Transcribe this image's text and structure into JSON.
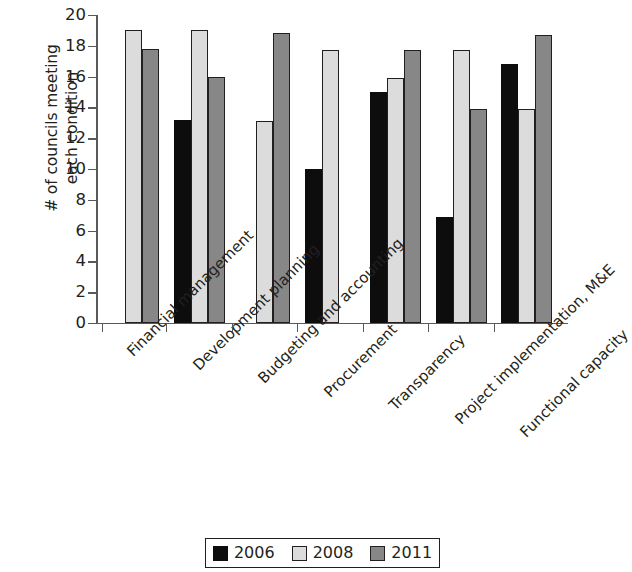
{
  "chart_data": {
    "type": "bar",
    "title": "",
    "subtitle": "",
    "xlabel": "",
    "ylabel": "# of councils meeting\neach condition",
    "ylim": [
      0,
      20
    ],
    "ytick_step": 2,
    "yticks": [
      20,
      18,
      16,
      14,
      12,
      10,
      8,
      6,
      4,
      2,
      0
    ],
    "grid": false,
    "legend_position": "bottom-center",
    "categories": [
      "Financial management",
      "Development planning",
      "Budgeting and accounting",
      "Procurement",
      "Transparency",
      "Project implementation, M&E",
      "Functional capacity"
    ],
    "series": [
      {
        "name": "2006",
        "color": "#0d0d0d",
        "values": [
          null,
          13.2,
          null,
          10.0,
          15.0,
          6.9,
          16.8
        ]
      },
      {
        "name": "2008",
        "color": "#dcdcdc",
        "values": [
          19.0,
          19.0,
          13.1,
          17.7,
          15.9,
          17.7,
          13.9
        ]
      },
      {
        "name": "2011",
        "color": "#878787",
        "values": [
          17.8,
          16.0,
          18.8,
          null,
          17.7,
          13.9,
          18.7
        ]
      }
    ]
  },
  "legend": {
    "items": [
      {
        "label": "2006",
        "color": "#0d0d0d"
      },
      {
        "label": "2008",
        "color": "#dcdcdc"
      },
      {
        "label": "2011",
        "color": "#878787"
      }
    ]
  },
  "axes": {
    "y_title": "# of councils meeting\neach condition",
    "y_tick_labels": [
      "20",
      "18",
      "16",
      "14",
      "12",
      "10",
      "8",
      "6",
      "4",
      "2",
      "0"
    ]
  },
  "colors": {
    "series_2006": "#0d0d0d",
    "series_2008": "#dcdcdc",
    "series_2011": "#878787",
    "axis": "#58595b",
    "text": "#231f20",
    "background": "#ffffff"
  }
}
